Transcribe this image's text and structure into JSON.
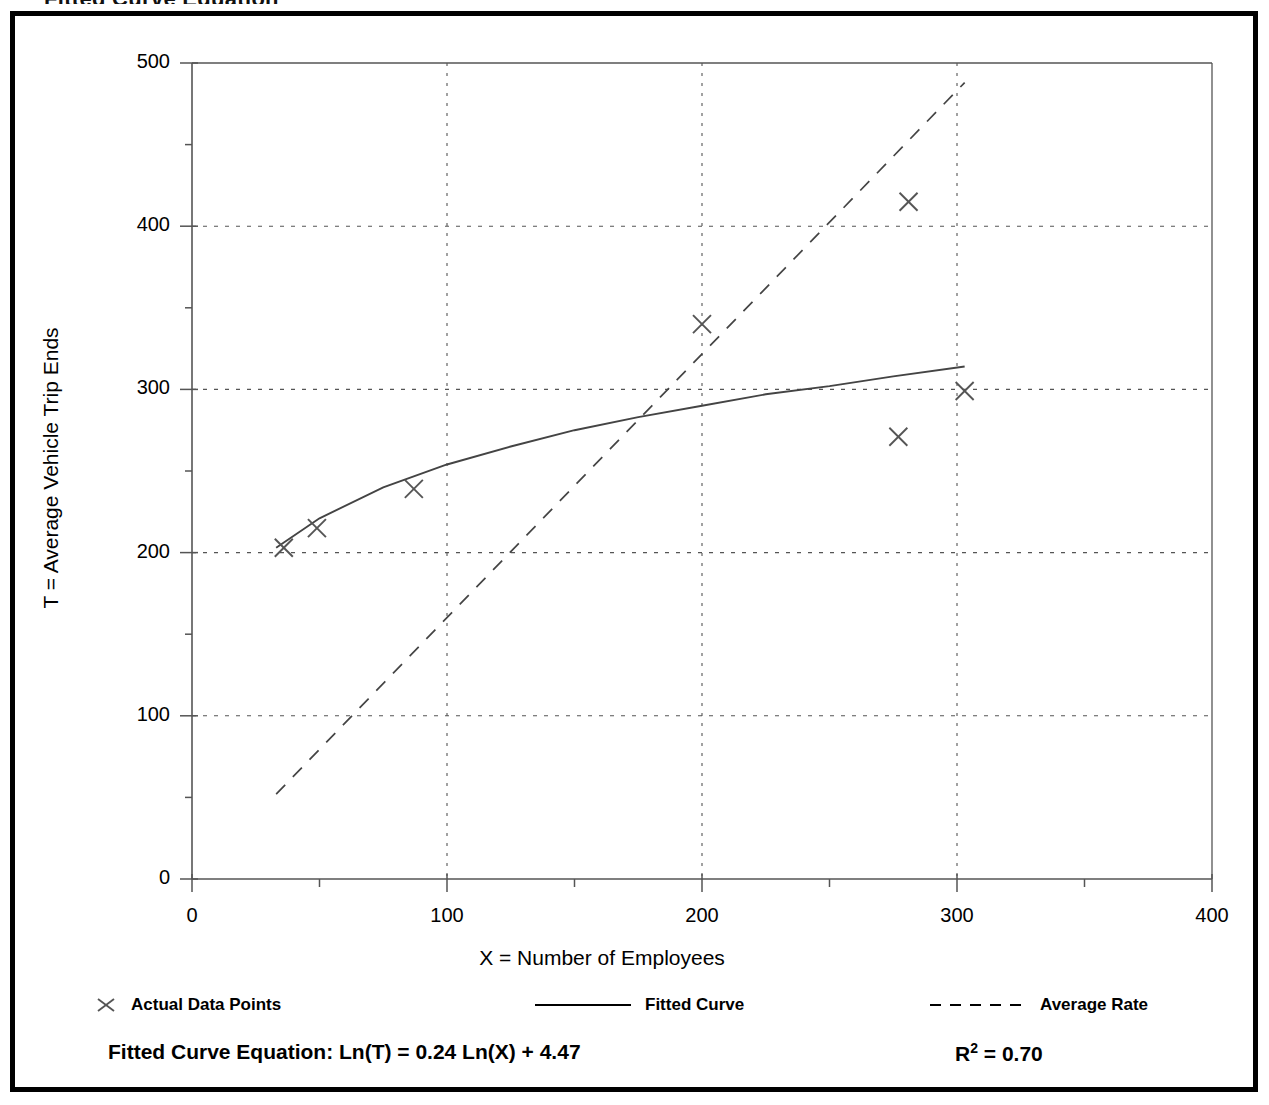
{
  "top_heading": "Fitted Curve Equation",
  "colors": {
    "frame": "#000000",
    "axis": "#555555",
    "grid": "#555555",
    "fitted_curve": "#444444",
    "average_rate": "#444444",
    "marker": "#555555",
    "text": "#000000",
    "background": "#ffffff"
  },
  "axis_titles": {
    "y": "T = Average Vehicle Trip Ends",
    "x": "X = Number of Employees"
  },
  "legend": {
    "items": [
      {
        "label": "Actual Data Points",
        "style": "marker-x",
        "icon": "x-marker-icon"
      },
      {
        "label": "Fitted Curve",
        "style": "solid-line",
        "icon": "solid-line-icon"
      },
      {
        "label": "Average Rate",
        "style": "dashed-line",
        "icon": "dashed-line-icon"
      }
    ]
  },
  "footer": {
    "equation": "Fitted Curve Equation:  Ln(T) = 0.24 Ln(X) + 4.47",
    "rsq_prefix": "R",
    "rsq_exponent": "2",
    "rsq_value": " = 0.70"
  },
  "chart_data": {
    "type": "scatter",
    "title": "Fitted Curve Equation",
    "xlabel": "X = Number of Employees",
    "ylabel": "T = Average Vehicle Trip Ends",
    "xlim": [
      0,
      400
    ],
    "ylim": [
      0,
      500
    ],
    "xticks": [
      0,
      100,
      200,
      300,
      400
    ],
    "yticks": [
      0,
      100,
      200,
      300,
      400,
      500
    ],
    "xminor_step": 50,
    "yminor_step": 50,
    "grid": true,
    "grid_style": "dotted",
    "legend_position": "below-axes",
    "series": [
      {
        "name": "Actual Data Points",
        "type": "scatter",
        "marker": "x",
        "points": [
          {
            "x": 36,
            "y": 203
          },
          {
            "x": 49,
            "y": 215
          },
          {
            "x": 87,
            "y": 239
          },
          {
            "x": 200,
            "y": 340
          },
          {
            "x": 281,
            "y": 415
          },
          {
            "x": 277,
            "y": 271
          },
          {
            "x": 303,
            "y": 299
          }
        ]
      },
      {
        "name": "Fitted Curve",
        "type": "line",
        "line_style": "solid",
        "equation": "Ln(T) = 0.24 Ln(X) + 4.47",
        "r_squared": 0.7,
        "x_range": [
          33,
          303
        ],
        "points": [
          {
            "x": 33,
            "y": 203
          },
          {
            "x": 50,
            "y": 221
          },
          {
            "x": 75,
            "y": 240
          },
          {
            "x": 100,
            "y": 254
          },
          {
            "x": 125,
            "y": 265
          },
          {
            "x": 150,
            "y": 275
          },
          {
            "x": 175,
            "y": 283
          },
          {
            "x": 200,
            "y": 290
          },
          {
            "x": 225,
            "y": 297
          },
          {
            "x": 250,
            "y": 302
          },
          {
            "x": 275,
            "y": 308
          },
          {
            "x": 303,
            "y": 314
          }
        ]
      },
      {
        "name": "Average Rate",
        "type": "line",
        "line_style": "dashed",
        "points": [
          {
            "x": 33,
            "y": 52
          },
          {
            "x": 303,
            "y": 488
          }
        ]
      }
    ]
  }
}
